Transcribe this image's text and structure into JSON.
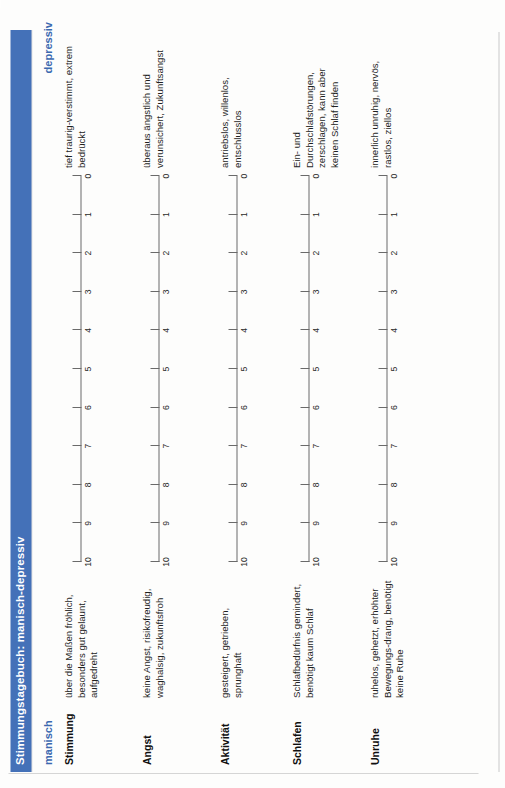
{
  "document": {
    "title": "Stimmungstagebuch: manisch-depressiv",
    "accent_color": "#4471b8",
    "pole_label_color": "#3b69b0"
  },
  "poles": {
    "left": "manisch",
    "right": "depressiv"
  },
  "scale": {
    "labels": [
      "10",
      "9",
      "8",
      "7",
      "6",
      "5",
      "4",
      "3",
      "2",
      "1",
      "0"
    ],
    "min": 0,
    "max": 10,
    "orientation": "left-high-to-right-low"
  },
  "rows": [
    {
      "label": "Stimmung",
      "manisch": "über die Maßen fröhlich, besonders gut gelaunt, aufgedreht",
      "depressiv": "tief traurig-verstimmt, extrem bedrückt"
    },
    {
      "label": "Angst",
      "manisch": "keine Angst, risikofreudig, waghalsig, zukunftsfroh",
      "depressiv": "überaus ängstlich und verunsichert, Zukunftsangst"
    },
    {
      "label": "Aktivität",
      "manisch": "gesteigert, getrieben, sprunghaft",
      "depressiv": "antriebslos, willenlos, entschlusslos"
    },
    {
      "label": "Schlafen",
      "manisch": "Schlafbedürfnis gemindert, benötigt kaum Schlaf",
      "depressiv": "Ein- und Durchschlafstörungen, zerschlagen, kann aber keinen Schlaf finden"
    },
    {
      "label": "Unruhe",
      "manisch": "ruhelos, gehetzt, erhöhter Bewegungs-drang, benötigt keine Ruhe",
      "depressiv": "innerlich unruhig, nervös, rastlos, ziellos"
    }
  ]
}
